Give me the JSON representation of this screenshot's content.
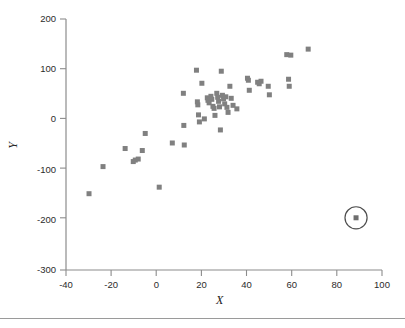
{
  "figure": {
    "title": "",
    "background_color": "#ffffff",
    "axis_color": "#8c8c8c",
    "marker_color": "#808080",
    "highlight_color": "#6e6e6e",
    "text_color": "#2b2b2b",
    "footer_rule_color": "#9a9a9a"
  },
  "chart_data": {
    "type": "scatter",
    "title": "",
    "xlabel": "X",
    "ylabel": "Y",
    "xlim": [
      -40,
      100
    ],
    "ylim": [
      -300,
      200
    ],
    "xticks": [
      -40,
      -20,
      0,
      20,
      40,
      60,
      80,
      100
    ],
    "yticks": [
      -300,
      -200,
      -100,
      0,
      100,
      200
    ],
    "xticklabels": [
      "-40",
      "-20",
      "0",
      "20",
      "40",
      "60",
      "80",
      "100"
    ],
    "yticklabels": [
      "-300",
      "-200",
      "-100",
      "0",
      "100",
      "200"
    ],
    "grid": false,
    "legend": null,
    "marker": "square",
    "marker_size": 5,
    "series": [
      {
        "name": "observations",
        "points": [
          [
            -29.8,
            -148
          ],
          [
            -23.6,
            -94
          ],
          [
            -13.8,
            -58
          ],
          [
            -10.2,
            -84
          ],
          [
            -9.3,
            -81
          ],
          [
            -8.0,
            -79
          ],
          [
            -6.2,
            -62
          ],
          [
            -4.9,
            -28
          ],
          [
            1.3,
            -135
          ],
          [
            7.1,
            -47
          ],
          [
            12.0,
            52
          ],
          [
            12.2,
            -12
          ],
          [
            12.4,
            -51
          ],
          [
            17.8,
            98
          ],
          [
            18.2,
            35
          ],
          [
            18.4,
            29
          ],
          [
            18.7,
            9
          ],
          [
            19.1,
            -5
          ],
          [
            20.2,
            72
          ],
          [
            21.3,
            1
          ],
          [
            22.6,
            43
          ],
          [
            22.9,
            38
          ],
          [
            23.4,
            33
          ],
          [
            24.2,
            46
          ],
          [
            24.6,
            40
          ],
          [
            25.1,
            26
          ],
          [
            25.6,
            22
          ],
          [
            26.0,
            8
          ],
          [
            26.8,
            52
          ],
          [
            27.2,
            44
          ],
          [
            27.6,
            36
          ],
          [
            28.0,
            25
          ],
          [
            28.4,
            -21
          ],
          [
            28.8,
            96
          ],
          [
            29.3,
            48
          ],
          [
            29.8,
            41
          ],
          [
            30.3,
            31
          ],
          [
            30.8,
            45
          ],
          [
            31.3,
            24
          ],
          [
            31.8,
            14
          ],
          [
            32.6,
            66
          ],
          [
            33.2,
            42
          ],
          [
            34.0,
            28
          ],
          [
            35.7,
            21
          ],
          [
            40.4,
            82
          ],
          [
            40.8,
            78
          ],
          [
            41.2,
            58
          ],
          [
            44.9,
            74
          ],
          [
            45.6,
            71
          ],
          [
            46.4,
            76
          ],
          [
            49.6,
            66
          ],
          [
            50.1,
            49
          ],
          [
            57.8,
            129
          ],
          [
            58.6,
            80
          ],
          [
            58.9,
            66
          ],
          [
            59.6,
            128
          ],
          [
            67.3,
            140
          ]
        ]
      }
    ],
    "annotations": [
      {
        "kind": "circle-highlight",
        "label": "outlier",
        "point": [
          88.5,
          -196
        ],
        "radius_data_x": 4.9,
        "note": "Circled outlier point at far right, low Y"
      }
    ]
  }
}
